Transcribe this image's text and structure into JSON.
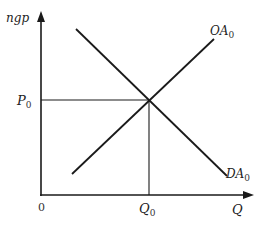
{
  "diagram": {
    "type": "supply-demand",
    "axes": {
      "y_label": "ngp",
      "x_label": "Q",
      "origin_label": "0"
    },
    "equilibrium": {
      "price_label": "P",
      "price_sub": "0",
      "quantity_label": "Q",
      "quantity_sub": "0"
    },
    "curves": [
      {
        "name": "OA",
        "sub": "0",
        "role": "aggregate supply (upward sloping)"
      },
      {
        "name": "DA",
        "sub": "0",
        "role": "aggregate demand (downward sloping)"
      }
    ],
    "colors": {
      "line": "#1a1a1a",
      "background": "#ffffff"
    }
  }
}
